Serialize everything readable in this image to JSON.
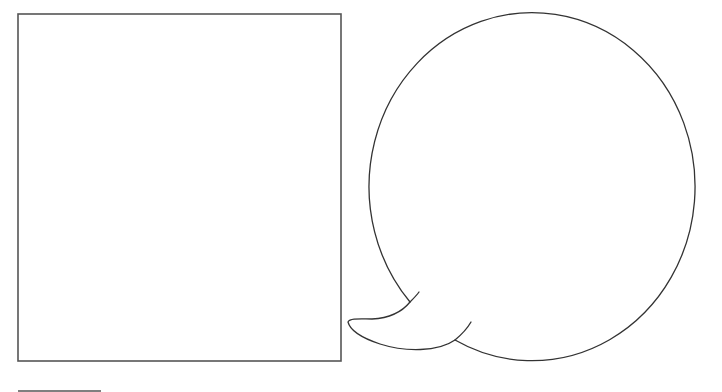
{
  "diagram": {
    "elements": [
      {
        "id": "panel",
        "kind": "square-frame",
        "text": ""
      },
      {
        "id": "speech-bubble",
        "kind": "speech-bubble",
        "tail_direction": "lower-left",
        "text": ""
      },
      {
        "id": "caption-rule",
        "kind": "horizontal-line",
        "text": ""
      }
    ],
    "colors": {
      "background": "#ffffff",
      "panel_stroke": "#555555",
      "bubble_stroke": "#333333"
    },
    "panel_text": "",
    "bubble_text": "",
    "caption_text": ""
  }
}
